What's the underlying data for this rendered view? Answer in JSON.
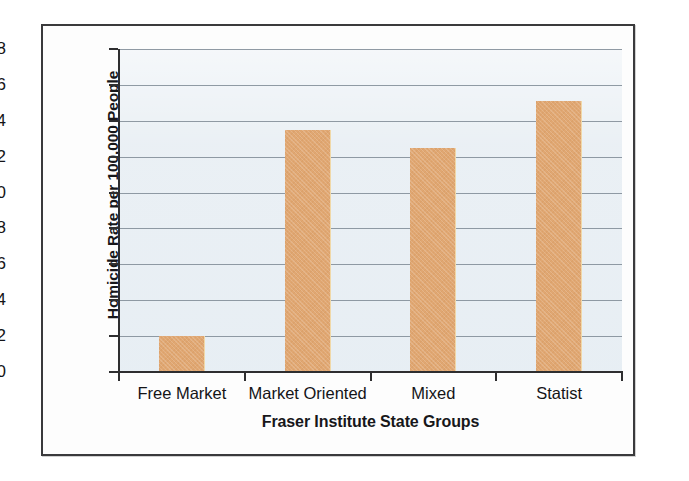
{
  "chart_data": {
    "type": "bar",
    "title": "",
    "categories": [
      "Free Market",
      "Market Oriented",
      "Mixed",
      "Statist"
    ],
    "values": [
      2.0,
      13.5,
      12.5,
      15.1
    ],
    "xlabel": "Fraser Institute State Groups",
    "ylabel": "Homicide Rate per 100,000 People",
    "ylim": [
      0,
      18
    ],
    "ytick_step": 2,
    "yticks": [
      0,
      2,
      4,
      6,
      8,
      10,
      12,
      14,
      16,
      18
    ],
    "ytick_labels": [
      "0",
      "2",
      "4",
      "6",
      "8",
      "10",
      "12",
      "14",
      "16",
      "18"
    ],
    "grid": true,
    "legend": false,
    "bar_color": "#E0A772",
    "plot_background": "#E9EFF4",
    "gridline_color": "#7E8A94",
    "axis_color": "#2E2E30",
    "page_background": "#FFFFFF",
    "frame_color": "#3A3A3C"
  }
}
